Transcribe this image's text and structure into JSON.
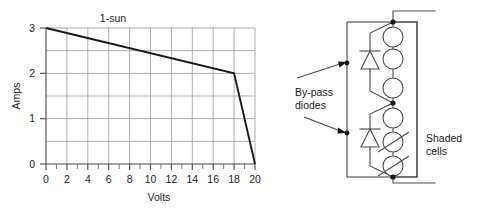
{
  "figure": {
    "background_color": "#ffffff",
    "ink_color": "#1a1a1a",
    "grid_color": "#9a9a9a"
  },
  "chart_data": {
    "type": "line",
    "title": "1-sun",
    "xlabel": "Volts",
    "ylabel": "Amps",
    "xlim": [
      0,
      20
    ],
    "ylim": [
      0,
      3
    ],
    "grid": true,
    "legend_position": "none",
    "x_major_ticks": [
      0,
      2,
      4,
      6,
      8,
      10,
      12,
      14,
      16,
      18,
      20
    ],
    "x_major_tick_labels": [
      "0",
      "2",
      "4",
      "6",
      "8",
      "10",
      "12",
      "14",
      "16",
      "18",
      "20"
    ],
    "x_minor_tick_step": 1,
    "y_major_ticks": [
      0,
      1,
      2,
      3
    ],
    "y_major_tick_labels": [
      "0",
      "1",
      "2",
      "3"
    ],
    "y_gridline_step": 0.5,
    "x_gridline_step": 2,
    "series": [
      {
        "name": "1-sun I-V curve",
        "x": [
          0,
          18,
          20
        ],
        "values": [
          3,
          2,
          0
        ]
      }
    ],
    "annotations": [
      {
        "text": "1-sun",
        "x": 6.4,
        "y": 3.15
      }
    ]
  },
  "circuit": {
    "labels": {
      "bypass_diodes": "By-pass\ndiodes",
      "bypass_diodes_line1": "By-pass",
      "bypass_diodes_line2": "diodes",
      "shaded_cells_line1": "Shaded",
      "shaded_cells_line2": "cells"
    },
    "cells": [
      {
        "id": "cell-1",
        "shaded": false,
        "group": "upper"
      },
      {
        "id": "cell-2",
        "shaded": false,
        "group": "upper"
      },
      {
        "id": "cell-3",
        "shaded": false,
        "group": "upper"
      },
      {
        "id": "cell-4",
        "shaded": false,
        "group": "lower"
      },
      {
        "id": "cell-5",
        "shaded": true,
        "group": "lower"
      },
      {
        "id": "cell-6",
        "shaded": true,
        "group": "lower"
      }
    ],
    "diodes": [
      {
        "id": "diode-upper",
        "orientation": "cathode-up"
      },
      {
        "id": "diode-lower",
        "orientation": "cathode-up"
      }
    ],
    "nodes": [
      {
        "id": "node-top"
      },
      {
        "id": "node-mid"
      },
      {
        "id": "node-bottom"
      }
    ],
    "terminals": [
      {
        "id": "terminal-top",
        "side": "right"
      },
      {
        "id": "terminal-bottom",
        "side": "right"
      }
    ]
  }
}
